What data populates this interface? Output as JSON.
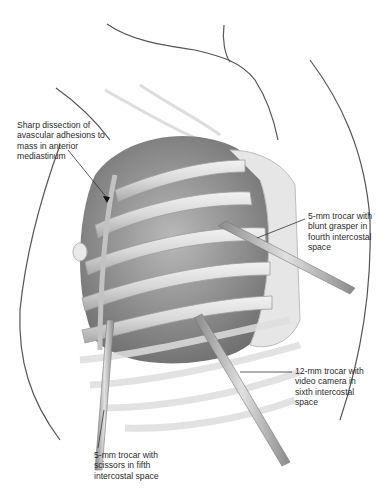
{
  "figure": {
    "type": "surgical-illustration",
    "colors": {
      "background": "#ffffff",
      "outline": "#555555",
      "rib": "#dcdcdc",
      "rib_shadow": "#a8a8a8",
      "cavity": "#9a9a9a",
      "trocar": "#b8b8b8",
      "leader_line": "#333333",
      "text": "#2a2a2a"
    }
  },
  "labels": [
    {
      "id": "dissection",
      "text": "Sharp dissection of\navascular adhesions to\nmass in anterior\nmediastinum"
    },
    {
      "id": "grasper",
      "text": "5-mm trocar with\nblunt grasper in\nfourth intercostal\nspace"
    },
    {
      "id": "camera",
      "text": "12-mm trocar with\nvideo camera in\nsixth intercostal\nspace"
    },
    {
      "id": "scissors",
      "text": "5-mm trocar with\nscissors in fifth\nintercostal space"
    }
  ]
}
